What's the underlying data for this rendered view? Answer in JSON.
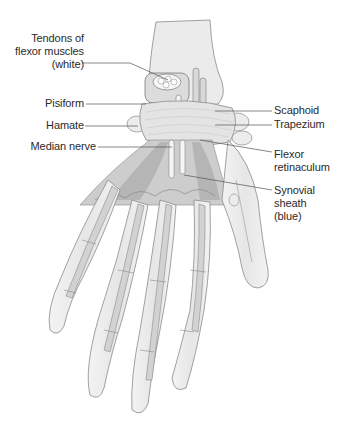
{
  "diagram": {
    "colors": {
      "bone": "#ececec",
      "bone_outline": "#8a8a8a",
      "tendon": "#d6d6d6",
      "muscle": "#b9b9b9",
      "retinaculum": "#e4e4e4",
      "leader_line": "#555555",
      "text": "#2a2a2a"
    },
    "labels": {
      "tendons": [
        "Tendons of",
        "flexor muscles",
        "(white)"
      ],
      "pisiform": "Pisiform",
      "hamate": "Hamate",
      "median_nerve": "Median nerve",
      "scaphoid": "Scaphoid",
      "trapezium": "Trapezium",
      "flexor_retinaculum": [
        "Flexor",
        "retinaculum"
      ],
      "synovial_sheath": [
        "Synovial",
        "sheath",
        "(blue)"
      ]
    }
  }
}
